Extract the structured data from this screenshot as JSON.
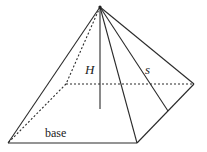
{
  "diagram": {
    "type": "square pyramid",
    "labels": {
      "height": "H",
      "slant": "s",
      "base": "base"
    },
    "colors": {
      "line": "#2a2a2a",
      "background": "#ffffff"
    }
  }
}
